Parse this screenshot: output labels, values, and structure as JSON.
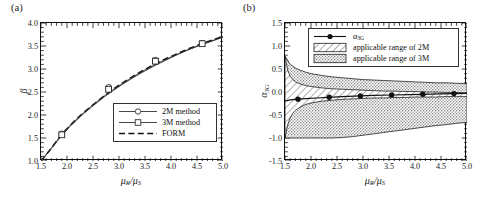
{
  "figure": {
    "panels": [
      {
        "tag": "(a)",
        "xlabel_main": "μ",
        "xlabel_sub1": "R",
        "xlabel_sep": "/μ",
        "xlabel_sub2": "S",
        "ylabel": "β"
      },
      {
        "tag": "(b)",
        "xlabel_main": "μ",
        "xlabel_sub1": "R",
        "xlabel_sep": "/μ",
        "xlabel_sub2": "S",
        "ylabel_main": "α",
        "ylabel_sub": "3G"
      }
    ]
  },
  "legend_a": {
    "items": [
      {
        "label": "2M method",
        "marker": "open-circle",
        "line": "solid"
      },
      {
        "label": "3M method",
        "marker": "open-square",
        "line": "solid"
      },
      {
        "label": "FORM",
        "marker": "none",
        "line": "dashed"
      }
    ]
  },
  "legend_b": {
    "items": [
      {
        "label_main": "α",
        "label_sub": "3G",
        "marker": "filled-circle",
        "line": "solid",
        "swatch": "none"
      },
      {
        "label": "applicable range of 2M",
        "swatch": "hatch"
      },
      {
        "label": "applicable range of 3M",
        "swatch": "dots"
      }
    ]
  },
  "chart_data": [
    {
      "type": "line",
      "title": "(a)",
      "xlabel": "μR/μS",
      "ylabel": "β",
      "xlim": [
        1.5,
        5.0
      ],
      "ylim": [
        1.0,
        4.0
      ],
      "xticks": [
        "1.5",
        "2.0",
        "2.5",
        "3.0",
        "3.5",
        "4.0",
        "4.5",
        "5.0"
      ],
      "yticks": [
        "1.0",
        "1.5",
        "2.0",
        "2.5",
        "3.0",
        "3.5",
        "4.0"
      ],
      "xtick_values": [
        1.5,
        2.0,
        2.5,
        3.0,
        3.5,
        4.0,
        4.5,
        5.0
      ],
      "ytick_values": [
        1.0,
        1.5,
        2.0,
        2.5,
        3.0,
        3.5,
        4.0
      ],
      "minor_ticks_per_interval": 5,
      "grid": false,
      "legend_position": "lower-right-inside",
      "series": [
        {
          "name": "2M method",
          "marker": "open-circle",
          "linestyle": "solid",
          "x": [
            1.5,
            1.7,
            1.9,
            2.1,
            2.3,
            2.5,
            2.7,
            2.9,
            3.1,
            3.3,
            3.5,
            3.7,
            3.9,
            4.1,
            4.3,
            4.5,
            4.7,
            4.9,
            5.0
          ],
          "y": [
            1.0,
            1.28,
            1.58,
            1.82,
            2.03,
            2.22,
            2.4,
            2.56,
            2.71,
            2.85,
            2.98,
            3.1,
            3.21,
            3.31,
            3.41,
            3.5,
            3.58,
            3.66,
            3.7
          ],
          "marker_x": [
            1.9,
            2.8,
            3.7,
            4.6
          ],
          "marker_y": [
            1.59,
            2.6,
            3.19,
            3.56
          ]
        },
        {
          "name": "3M method",
          "marker": "open-square",
          "linestyle": "solid",
          "x": [
            1.5,
            1.7,
            1.9,
            2.1,
            2.3,
            2.5,
            2.7,
            2.9,
            3.1,
            3.3,
            3.5,
            3.7,
            3.9,
            4.1,
            4.3,
            4.5,
            4.7,
            4.9,
            5.0
          ],
          "y": [
            1.0,
            1.27,
            1.56,
            1.8,
            2.01,
            2.2,
            2.38,
            2.54,
            2.69,
            2.83,
            2.96,
            3.08,
            3.19,
            3.3,
            3.4,
            3.49,
            3.57,
            3.65,
            3.69
          ],
          "marker_x": [
            1.9,
            2.8,
            3.7,
            4.6
          ],
          "marker_y": [
            1.57,
            2.56,
            3.17,
            3.55
          ]
        },
        {
          "name": "FORM",
          "marker": "none",
          "linestyle": "dashed",
          "x": [
            1.5,
            1.7,
            1.9,
            2.1,
            2.3,
            2.5,
            2.7,
            2.9,
            3.1,
            3.3,
            3.5,
            3.7,
            3.9,
            4.1,
            4.3,
            4.5,
            4.7,
            4.9,
            5.0
          ],
          "y": [
            1.0,
            1.28,
            1.58,
            1.82,
            2.03,
            2.22,
            2.4,
            2.57,
            2.72,
            2.86,
            2.99,
            3.11,
            3.22,
            3.32,
            3.42,
            3.51,
            3.59,
            3.67,
            3.71
          ]
        }
      ]
    },
    {
      "type": "area",
      "title": "(b)",
      "xlabel": "μR/μS",
      "ylabel": "α3G",
      "xlim": [
        1.5,
        5.0
      ],
      "ylim": [
        -1.5,
        1.5
      ],
      "xticks": [
        "1.5",
        "2.0",
        "2.5",
        "3.0",
        "3.5",
        "4.0",
        "4.5",
        "5.0"
      ],
      "yticks": [
        "-1.5",
        "-1.0",
        "-0.5",
        "0.0",
        "0.5",
        "1.0",
        "1.5"
      ],
      "xtick_values": [
        1.5,
        2.0,
        2.5,
        3.0,
        3.5,
        4.0,
        4.5,
        5.0
      ],
      "ytick_values": [
        -1.5,
        -1.0,
        -0.5,
        0.0,
        0.5,
        1.0,
        1.5
      ],
      "minor_ticks_per_interval": 5,
      "grid": false,
      "legend_position": "top-inside",
      "series": [
        {
          "name": "applicable range of 3M",
          "type": "band",
          "fill": "dots",
          "x": [
            1.5,
            1.6,
            1.7,
            1.8,
            1.9,
            2.0,
            2.2,
            2.4,
            2.6,
            2.8,
            3.0,
            3.2,
            3.4,
            3.6,
            3.8,
            4.0,
            4.2,
            4.4,
            4.6,
            4.8,
            5.0
          ],
          "upper": [
            0.78,
            0.6,
            0.52,
            0.47,
            0.43,
            0.4,
            0.36,
            0.33,
            0.31,
            0.29,
            0.27,
            0.26,
            0.25,
            0.24,
            0.23,
            0.22,
            0.21,
            0.2,
            0.2,
            0.19,
            0.18
          ],
          "lower": [
            -1.0,
            -1.0,
            -1.0,
            -1.0,
            -1.0,
            -1.0,
            -1.0,
            -1.0,
            -0.99,
            -0.97,
            -0.94,
            -0.91,
            -0.88,
            -0.85,
            -0.82,
            -0.79,
            -0.76,
            -0.73,
            -0.71,
            -0.68,
            -0.66
          ]
        },
        {
          "name": "applicable range of 2M",
          "type": "band",
          "fill": "hatch",
          "x": [
            1.5,
            1.55,
            1.6,
            1.65,
            1.7,
            1.8,
            1.9,
            2.0,
            2.2,
            2.4,
            2.6,
            2.8,
            3.0,
            3.2,
            3.4,
            3.6,
            3.8,
            4.0,
            4.2,
            4.4,
            4.6,
            4.8,
            5.0
          ],
          "upper": [
            0.78,
            0.48,
            0.34,
            0.27,
            0.22,
            0.17,
            0.14,
            0.12,
            0.09,
            0.07,
            0.06,
            0.05,
            0.04,
            0.03,
            0.02,
            0.02,
            0.01,
            0.01,
            0.0,
            0.0,
            -0.01,
            -0.01,
            -0.02
          ],
          "lower": [
            -1.0,
            -0.72,
            -0.56,
            -0.46,
            -0.4,
            -0.32,
            -0.27,
            -0.24,
            -0.2,
            -0.18,
            -0.16,
            -0.15,
            -0.14,
            -0.13,
            -0.13,
            -0.12,
            -0.12,
            -0.11,
            -0.11,
            -0.11,
            -0.1,
            -0.1,
            -0.1
          ]
        },
        {
          "name": "α3G",
          "marker": "filled-circle",
          "linestyle": "solid",
          "x": [
            1.5,
            1.6,
            1.75,
            1.9,
            2.1,
            2.35,
            2.6,
            2.95,
            3.2,
            3.55,
            3.9,
            4.15,
            4.45,
            4.75,
            5.0
          ],
          "y": [
            -0.2,
            -0.17,
            -0.155,
            -0.145,
            -0.13,
            -0.115,
            -0.1,
            -0.085,
            -0.075,
            -0.065,
            -0.055,
            -0.05,
            -0.04,
            -0.035,
            -0.03
          ],
          "marker_x": [
            1.75,
            2.35,
            2.95,
            3.55,
            4.15,
            4.75
          ],
          "marker_y": [
            -0.155,
            -0.115,
            -0.085,
            -0.065,
            -0.05,
            -0.035
          ]
        }
      ]
    }
  ]
}
